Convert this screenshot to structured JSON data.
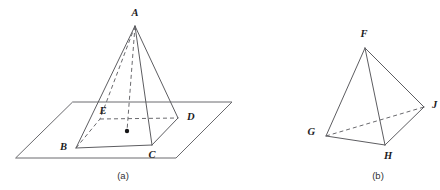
{
  "document": {
    "title": "Solid geometry figures: square pyramid in a plane and a tetrahedron",
    "background_color": "#ffffff",
    "line_color": "#5d5d61",
    "hidden_line_color": "#6a6a6e",
    "label_color": "#1b1b1d"
  },
  "figures": [
    {
      "id": "figure-a",
      "caption": "(a)",
      "caption_position": {
        "x": 123,
        "y": 176
      },
      "description": "Square pyramid with apex A standing on a horizontal plane; base square B C D E with center point marked",
      "shape_type": "square-pyramid-on-plane",
      "plane": {
        "name": "horizontal-plane",
        "corners": [
          {
            "x": 73,
            "y": 102
          },
          {
            "x": 232,
            "y": 102
          },
          {
            "x": 176,
            "y": 158
          },
          {
            "x": 16,
            "y": 158
          }
        ]
      },
      "vertices": [
        {
          "name": "A",
          "role": "apex",
          "x": 135,
          "y": 26,
          "label_x": 135,
          "label_y": 14,
          "hidden": false
        },
        {
          "name": "B",
          "role": "base-front-left",
          "x": 76,
          "y": 148,
          "label_x": 67,
          "label_y": 148,
          "hidden": false
        },
        {
          "name": "C",
          "role": "base-front-right",
          "x": 152,
          "y": 145,
          "label_x": 152,
          "label_y": 156,
          "hidden": false
        },
        {
          "name": "D",
          "role": "base-back-right",
          "x": 178,
          "y": 118,
          "label_x": 187,
          "label_y": 118,
          "hidden": false
        },
        {
          "name": "E",
          "role": "base-back-left",
          "x": 100,
          "y": 119,
          "label_x": 103,
          "label_y": 112,
          "hidden": true
        }
      ],
      "center_point": {
        "name": "base-center",
        "x": 127,
        "y": 131,
        "radius": 2.2
      },
      "solid_edges": [
        {
          "from": "A",
          "to": "B",
          "style": "solid"
        },
        {
          "from": "A",
          "to": "C",
          "style": "solid"
        },
        {
          "from": "A",
          "to": "D",
          "style": "solid"
        },
        {
          "from": "B",
          "to": "C",
          "style": "solid"
        },
        {
          "from": "C",
          "to": "D",
          "style": "solid"
        }
      ],
      "hidden_edges": [
        {
          "from": "A",
          "to": "E",
          "style": "dashed"
        },
        {
          "from": "B",
          "to": "E",
          "style": "dashed"
        },
        {
          "from": "E",
          "to": "D",
          "style": "dashed"
        },
        {
          "from": "A",
          "to": "center",
          "style": "dashed",
          "note": "altitude from apex to base center"
        }
      ]
    },
    {
      "id": "figure-b",
      "caption": "(b)",
      "caption_position": {
        "x": 378,
        "y": 176
      },
      "description": "Tetrahedron with apex F and base triangle G H J",
      "shape_type": "tetrahedron",
      "vertices": [
        {
          "name": "F",
          "role": "apex",
          "x": 365,
          "y": 48,
          "label_x": 364,
          "label_y": 35,
          "hidden": false
        },
        {
          "name": "G",
          "role": "base-left",
          "x": 326,
          "y": 136,
          "label_x": 315,
          "label_y": 133,
          "hidden": false
        },
        {
          "name": "H",
          "role": "base-front",
          "x": 385,
          "y": 145,
          "label_x": 388,
          "label_y": 157,
          "hidden": false
        },
        {
          "name": "J",
          "role": "base-right",
          "x": 424,
          "y": 107,
          "label_x": 432,
          "label_y": 106,
          "hidden": false
        }
      ],
      "solid_edges": [
        {
          "from": "F",
          "to": "G",
          "style": "solid"
        },
        {
          "from": "F",
          "to": "H",
          "style": "solid"
        },
        {
          "from": "F",
          "to": "J",
          "style": "solid"
        },
        {
          "from": "G",
          "to": "H",
          "style": "solid"
        },
        {
          "from": "H",
          "to": "J",
          "style": "solid"
        }
      ],
      "hidden_edges": [
        {
          "from": "G",
          "to": "J",
          "style": "dashed"
        }
      ]
    }
  ]
}
